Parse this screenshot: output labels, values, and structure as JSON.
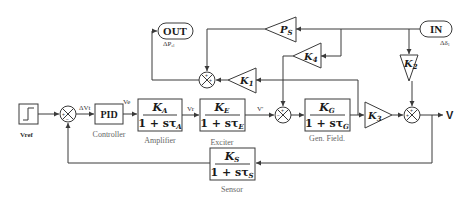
{
  "diagram": {
    "type": "control-block-diagram",
    "input": {
      "label": "V_ref",
      "display": "Vref"
    },
    "output": {
      "label": "V"
    },
    "signals": {
      "error": "ΔVt",
      "pid_out": "Ve",
      "amp_out": "Vr",
      "exciter_out": "V'"
    },
    "blocks": {
      "pid": {
        "label": "PID",
        "caption": "Controller"
      },
      "amplifier": {
        "num": "K_A",
        "num_main": "K",
        "num_sub": "A",
        "den": "1 + sτ_A",
        "den_main": "1 + sτ",
        "den_sub": "A",
        "caption": "Amplifier"
      },
      "exciter": {
        "num": "K_E",
        "num_main": "K",
        "num_sub": "E",
        "den": "1 + sτ_E",
        "den_main": "1 + sτ",
        "den_sub": "E",
        "caption": "Exciter"
      },
      "generator_field": {
        "num": "K_G",
        "num_main": "K",
        "num_sub": "G",
        "den": "1 + sτ_G",
        "den_main": "1 + sτ",
        "den_sub": "G",
        "caption": "Gen. Field."
      },
      "sensor": {
        "num": "K_S",
        "num_main": "K",
        "num_sub": "S",
        "den": "1 + sτ_S",
        "den_main": "1 + sτ",
        "den_sub": "S",
        "caption": "Sensor"
      }
    },
    "gains": {
      "k1": {
        "main": "K",
        "sub": "1"
      },
      "k2": {
        "main": "K",
        "sub": "2"
      },
      "k3": {
        "main": "K",
        "sub": "3"
      },
      "k4": {
        "main": "K",
        "sub": "4"
      },
      "ps": {
        "main": "P",
        "sub": "S"
      }
    },
    "ports": {
      "out": {
        "label": "OUT",
        "signal": "ΔPel",
        "signal_main": "ΔP",
        "signal_sub": "el"
      },
      "in": {
        "label": "IN",
        "signal": "Δδ1",
        "signal_main": "Δδ",
        "signal_sub": "1"
      }
    },
    "summing_junction_signs": {
      "sum_ref": [
        "+",
        "−"
      ],
      "sum_top": [
        "+",
        "+"
      ],
      "sum_gen": [
        "+",
        "−"
      ],
      "sum_out": [
        "+",
        "+"
      ]
    },
    "colors": {
      "line": "#3a3a3a",
      "text": "#1a1a1a",
      "caption": "#666666"
    }
  }
}
